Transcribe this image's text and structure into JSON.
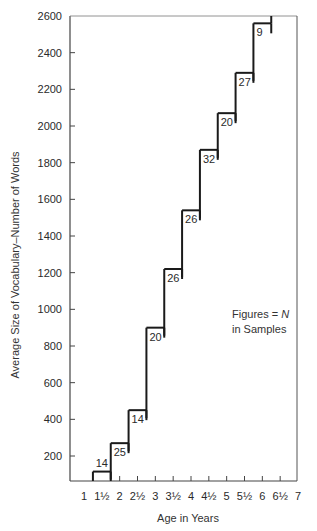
{
  "chart_data": {
    "type": "step",
    "title": "",
    "xlabel": "Age in Years",
    "ylabel": "Average Size of Vocabulary–Number of Words",
    "x_tick_labels": [
      "1",
      "1½",
      "2",
      "2½",
      "3",
      "3½",
      "4",
      "4½",
      "5",
      "5½",
      "6",
      "6½",
      "7"
    ],
    "x_ticks": [
      1,
      1.5,
      2,
      2.5,
      3,
      3.5,
      4,
      4.5,
      5,
      5.5,
      6,
      6.5,
      7
    ],
    "y_tick_labels": [
      "200",
      "400",
      "600",
      "800",
      "1000",
      "1200",
      "1400",
      "1600",
      "1800",
      "2000",
      "2200",
      "2400",
      "2600"
    ],
    "y_ticks": [
      200,
      400,
      600,
      800,
      1000,
      1200,
      1400,
      1600,
      1800,
      2000,
      2200,
      2400,
      2600
    ],
    "ylim": [
      65,
      2600
    ],
    "xlim": [
      0.65,
      7
    ],
    "grid": false,
    "annotation": "Figures = N in Samples",
    "series": [
      {
        "name": "Average vocabulary size",
        "steps": [
          {
            "x_start": 1.25,
            "x_end": 1.75,
            "age": "1½",
            "value": 115,
            "n": 14
          },
          {
            "x_start": 1.75,
            "x_end": 2.25,
            "age": "2",
            "value": 270,
            "n": 25
          },
          {
            "x_start": 2.25,
            "x_end": 2.75,
            "age": "2½",
            "value": 450,
            "n": 14
          },
          {
            "x_start": 2.75,
            "x_end": 3.25,
            "age": "3",
            "value": 900,
            "n": 20
          },
          {
            "x_start": 3.25,
            "x_end": 3.75,
            "age": "3½",
            "value": 1220,
            "n": 26
          },
          {
            "x_start": 3.75,
            "x_end": 4.25,
            "age": "4",
            "value": 1540,
            "n": 26
          },
          {
            "x_start": 4.25,
            "x_end": 4.75,
            "age": "4½",
            "value": 1870,
            "n": 32
          },
          {
            "x_start": 4.75,
            "x_end": 5.25,
            "age": "5",
            "value": 2070,
            "n": 20
          },
          {
            "x_start": 5.25,
            "x_end": 5.75,
            "age": "5½",
            "value": 2290,
            "n": 27
          },
          {
            "x_start": 5.75,
            "x_end": 6.25,
            "age": "6",
            "value": 2560,
            "n": 9
          }
        ]
      }
    ]
  },
  "legend": {
    "line1_prefix": "Figures = ",
    "line1_symbol": "N",
    "line2": "in Samples"
  },
  "colors": {
    "line": "#1a1a1a",
    "axis": "#444444",
    "text": "#2a2a2a"
  }
}
